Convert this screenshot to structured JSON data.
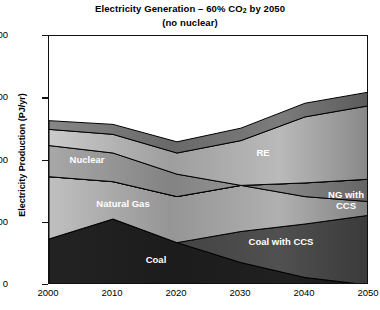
{
  "chart_data": {
    "type": "area",
    "stacked": true,
    "title": "Electricity Generation – 60% CO2 by 2050",
    "title_line1_pre": "Electricity Generation – 60% CO",
    "title_line1_sub": "2",
    "title_line1_post": " by 2050",
    "subtitle": "(no nuclear)",
    "xlabel": "",
    "ylabel": "Electricity Production (PJ/yr)",
    "x": [
      2000,
      2010,
      2020,
      2030,
      2040,
      2050
    ],
    "xlim": [
      2000,
      2050
    ],
    "ylim": [
      0,
      2000
    ],
    "xticks": [
      2000,
      2010,
      2020,
      2030,
      2040,
      2050
    ],
    "yticks": [
      0,
      500,
      1000,
      1500,
      2000
    ],
    "grid": false,
    "legend": "in-plot labels",
    "series": [
      {
        "name": "Coal",
        "label": "Coal",
        "values": [
          370,
          530,
          340,
          180,
          60,
          0
        ]
      },
      {
        "name": "Coal with CCS",
        "label": "Coal with CCS",
        "values": [
          0,
          0,
          0,
          250,
          430,
          560
        ]
      },
      {
        "name": "Natural Gas",
        "label": "Natural Gas",
        "values": [
          500,
          300,
          370,
          370,
          220,
          110
        ]
      },
      {
        "name": "NG with CCS",
        "label": "NG with CCS",
        "values": [
          0,
          0,
          0,
          0,
          110,
          180
        ]
      },
      {
        "name": "Nuclear",
        "label": "Nuclear",
        "values": [
          250,
          230,
          180,
          0,
          0,
          0
        ]
      },
      {
        "name": "RE",
        "label": "RE",
        "values": [
          130,
          150,
          170,
          360,
          530,
          590
        ]
      },
      {
        "name": "CHP",
        "label": "CHP",
        "values": [
          70,
          80,
          90,
          100,
          110,
          110
        ]
      }
    ],
    "totals": [
      1320,
      1290,
      1150,
      1260,
      1460,
      1550
    ],
    "series_label_positions": [
      {
        "key": "CHP",
        "x": 243,
        "y": 115
      },
      {
        "key": "RE",
        "x": 262,
        "y": 151
      },
      {
        "key": "Nuclear",
        "x": 86,
        "y": 158
      },
      {
        "key": "Natural Gas",
        "x": 122,
        "y": 202
      },
      {
        "key": "NG with CCS",
        "x": 345,
        "y": 199
      },
      {
        "key": "Coal with CCS",
        "x": 280,
        "y": 240
      },
      {
        "key": "Coal",
        "x": 155,
        "y": 258
      }
    ]
  },
  "colors": {
    "axis": "#111111",
    "label_text": "#ffffff",
    "coal": "#1d1d1d",
    "coal_ccs": "#474747",
    "natural_gas": "#9d9d9d",
    "ng_ccs": "#7a7a7a",
    "nuclear": "#8a8a8a",
    "re": "#a6a6a6",
    "chp": "#6f6f6f",
    "background": "#ffffff"
  }
}
